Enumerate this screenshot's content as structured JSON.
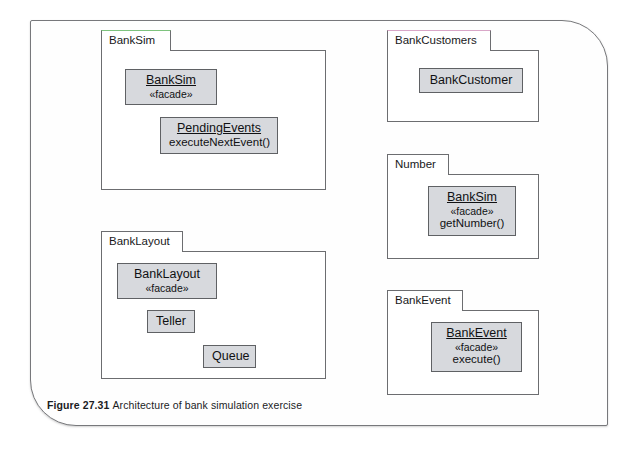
{
  "figure": {
    "caption_label": "Figure 27.31",
    "caption_text": "Architecture of bank simulation exercise",
    "page_background": "#fefefe",
    "page_border_color": "#77787b"
  },
  "style": {
    "class_fill": "#d7d9dd",
    "class_border": "#5f6164",
    "package_border": "#6c6d70",
    "accent_green": "#7ec37e",
    "accent_pink": "#d9a7c8"
  },
  "packages": [
    {
      "id": "banksim",
      "name": "BankSim",
      "tab_accent": "green",
      "classes": [
        {
          "name": "BankSim",
          "underlined": true,
          "stereotype": "«facade»",
          "operation": ""
        },
        {
          "name": "PendingEvents",
          "underlined": true,
          "stereotype": "",
          "operation": "executeNextEvent()"
        }
      ]
    },
    {
      "id": "banklayout",
      "name": "BankLayout",
      "tab_accent": "none",
      "classes": [
        {
          "name": "BankLayout",
          "underlined": false,
          "stereotype": "«facade»",
          "operation": ""
        },
        {
          "name": "Teller",
          "underlined": false,
          "stereotype": "",
          "operation": ""
        },
        {
          "name": "Queue",
          "underlined": false,
          "stereotype": "",
          "operation": ""
        }
      ]
    },
    {
      "id": "bankcustomers",
      "name": "BankCustomers",
      "tab_accent": "pink",
      "classes": [
        {
          "name": "BankCustomer",
          "underlined": false,
          "stereotype": "",
          "operation": ""
        }
      ]
    },
    {
      "id": "number",
      "name": "Number",
      "tab_accent": "none",
      "classes": [
        {
          "name": "BankSim",
          "underlined": true,
          "stereotype": "«facade»",
          "operation": "getNumber()"
        }
      ]
    },
    {
      "id": "bankevent",
      "name": "BankEvent",
      "tab_accent": "none",
      "classes": [
        {
          "name": "BankEvent",
          "underlined": true,
          "stereotype": "«facade»",
          "operation": "execute()"
        }
      ]
    }
  ]
}
